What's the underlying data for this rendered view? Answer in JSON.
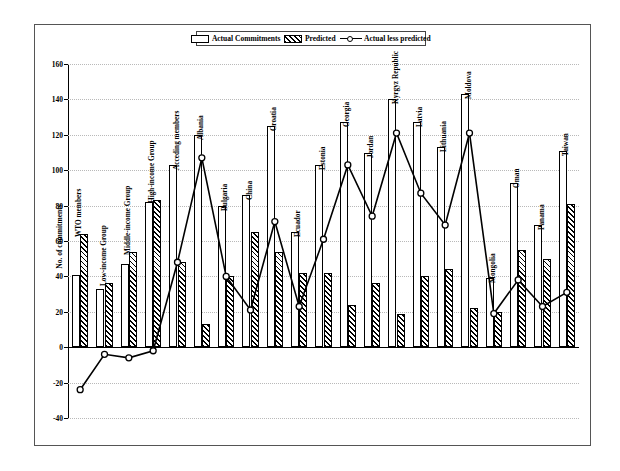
{
  "legend": {
    "items": [
      {
        "label": "Actual Commitments",
        "marker": "open-box"
      },
      {
        "label": "Predicted",
        "marker": "hatched-box"
      },
      {
        "label": "Actual less predicted",
        "marker": "line-circle"
      }
    ]
  },
  "colors": {
    "series_actual": "#ffffff",
    "series_predicted": "#000000",
    "line": "#000000",
    "grid": "#b9b9b9",
    "frame": "#555555",
    "axis": "#000000"
  },
  "chart_data": {
    "type": "bar",
    "title": "",
    "xlabel": "",
    "ylabel": "No. of commitments",
    "ylim": [
      -40,
      160
    ],
    "ytick_step": 20,
    "yticks": [
      -40,
      -20,
      0,
      20,
      40,
      60,
      80,
      100,
      120,
      140,
      160
    ],
    "grid": true,
    "legend_position": "top-center",
    "categories": [
      "WTO members",
      "Low-income Group",
      "Middle-income Group",
      "High-income Group",
      "Acceding members",
      "Albania",
      "Bulgaria",
      "China",
      "Croatia",
      "Ecuador",
      "Estonia",
      "Georgia",
      "Jordan",
      "Kyrgyz Republic",
      "Latvia",
      "Lithuania",
      "Moldova",
      "Mongolia",
      "Oman",
      "Panama",
      "Taiwan"
    ],
    "series": [
      {
        "name": "Actual Commitments",
        "type": "bar",
        "values": [
          41,
          33,
          47,
          82,
          103,
          120,
          80,
          86,
          125,
          65,
          103,
          127,
          110,
          140,
          127,
          113,
          143,
          39,
          93,
          69,
          111
        ]
      },
      {
        "name": "Predicted",
        "type": "bar",
        "values": [
          64,
          36,
          54,
          83,
          48,
          13,
          40,
          65,
          54,
          42,
          42,
          24,
          36,
          19,
          40,
          44,
          22,
          20,
          55,
          50,
          81
        ]
      },
      {
        "name": "Actual less predicted",
        "type": "line",
        "values": [
          -24,
          -4,
          -6,
          -2,
          48,
          107,
          40,
          21,
          71,
          23,
          61,
          103,
          74,
          121,
          87,
          69,
          121,
          19,
          38,
          23,
          31
        ]
      }
    ]
  }
}
